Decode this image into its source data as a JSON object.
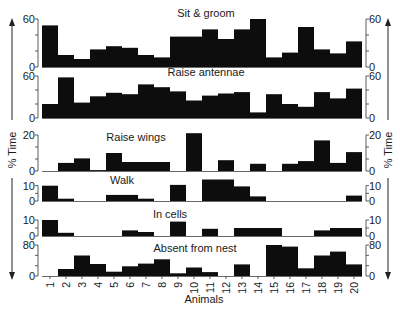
{
  "chart_data": {
    "type": "bar",
    "layout": "stacked-panels",
    "ylabel": "% Time",
    "xlabel": "Animals",
    "categories": [
      "1",
      "2",
      "3",
      "4",
      "5",
      "6",
      "7",
      "8",
      "9",
      "10",
      "11",
      "12",
      "13",
      "14",
      "15",
      "16",
      "17",
      "18",
      "19",
      "20"
    ],
    "grid": false,
    "panels": [
      {
        "title": "Sit & groom",
        "ylim": [
          0,
          60
        ],
        "yticks": [
          0,
          60
        ],
        "values": [
          52,
          15,
          10,
          22,
          26,
          24,
          15,
          12,
          38,
          38,
          47,
          35,
          47,
          60,
          12,
          18,
          50,
          22,
          17,
          32
        ]
      },
      {
        "title": "Raise antennae",
        "ylim": [
          0,
          60
        ],
        "yticks": [
          0,
          60
        ],
        "values": [
          20,
          58,
          22,
          31,
          36,
          34,
          48,
          44,
          38,
          25,
          32,
          35,
          37,
          8,
          34,
          20,
          16,
          37,
          28,
          42
        ]
      },
      {
        "title": "Raise wings",
        "ylim": [
          0,
          20
        ],
        "yticks": [
          0,
          20
        ],
        "values": [
          0,
          4.5,
          7,
          0.5,
          10,
          5,
          5,
          5,
          0,
          21,
          0,
          6,
          0,
          4,
          0,
          4,
          5.5,
          17,
          4.5,
          10.5
        ]
      },
      {
        "title": "Walk",
        "ylim": [
          0,
          15
        ],
        "yticks": [
          0,
          10
        ],
        "values": [
          10,
          1.5,
          0,
          0,
          4,
          4,
          1.5,
          0,
          10.5,
          0,
          14,
          14,
          9.5,
          3,
          0,
          0,
          0,
          0,
          0,
          3.5
        ]
      },
      {
        "title": "In cells",
        "ylim": [
          0,
          15
        ],
        "yticks": [
          0,
          10
        ],
        "values": [
          10,
          2,
          0,
          0,
          0,
          3.5,
          2.5,
          0,
          9,
          0,
          4.5,
          0,
          5,
          5,
          5,
          0,
          0,
          3.5,
          5,
          5
        ]
      },
      {
        "title": "Absent from nest",
        "ylim": [
          0,
          80
        ],
        "yticks": [
          0,
          80
        ],
        "values": [
          0,
          18,
          53,
          31,
          11,
          25,
          32,
          43,
          7,
          22,
          10,
          0,
          30,
          0,
          80,
          76,
          20,
          53,
          63,
          30
        ]
      }
    ]
  },
  "labels": {
    "ylabel_left": "% Time",
    "ylabel_right": "% Time",
    "xlabel": "Animals"
  }
}
